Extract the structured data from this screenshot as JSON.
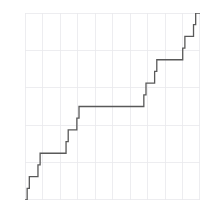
{
  "chart_data": {
    "type": "line",
    "title": "",
    "subtitle": "",
    "xlabel": "",
    "ylabel": "",
    "xlim": [
      0,
      1
    ],
    "ylim": [
      0,
      1
    ],
    "grid": true,
    "grid_color": "#e9e9ec",
    "x_gridlines": [
      0,
      0.1,
      0.2,
      0.3,
      0.4,
      0.5,
      0.6,
      0.7,
      0.8,
      0.9,
      1
    ],
    "y_gridlines": [
      0,
      0.2,
      0.4,
      0.6,
      0.8,
      1
    ],
    "xtick_labels": [],
    "ytick_labels": [],
    "legend": [],
    "legend_position": "none",
    "annotations": [],
    "series": [
      {
        "name": "Cantor function",
        "color": "#595959",
        "line_width": 1.3,
        "step": "post",
        "x": [
          0.0,
          0.012345679,
          0.012345679,
          0.024691358,
          0.024691358,
          0.037037037,
          0.037037037,
          0.074074074,
          0.074074074,
          0.086419753,
          0.086419753,
          0.098765432,
          0.098765432,
          0.111111111,
          0.111111111,
          0.222222222,
          0.222222222,
          0.234567901,
          0.234567901,
          0.24691358,
          0.24691358,
          0.259259259,
          0.259259259,
          0.296296296,
          0.296296296,
          0.308641975,
          0.308641975,
          0.320987654,
          0.320987654,
          0.333333333,
          0.333333333,
          0.666666667,
          0.666666667,
          0.679012346,
          0.679012346,
          0.691358025,
          0.691358025,
          0.703703704,
          0.703703704,
          0.740740741,
          0.740740741,
          0.75308642,
          0.75308642,
          0.765432099,
          0.765432099,
          0.777777778,
          0.777777778,
          0.888888889,
          0.888888889,
          0.901234568,
          0.901234568,
          0.913580247,
          0.913580247,
          0.925925926,
          0.925925926,
          0.962962963,
          0.962962963,
          0.975308642,
          0.975308642,
          0.987654321,
          0.987654321,
          1.0
        ],
        "y": [
          0.0,
          0.0,
          0.0625,
          0.0625,
          0.125,
          0.125,
          0.125,
          0.125,
          0.1875,
          0.1875,
          0.25,
          0.25,
          0.25,
          0.25,
          0.25,
          0.25,
          0.25,
          0.25,
          0.3125,
          0.3125,
          0.375,
          0.375,
          0.375,
          0.375,
          0.4375,
          0.4375,
          0.5,
          0.5,
          0.5,
          0.5,
          0.5,
          0.5,
          0.5,
          0.5,
          0.5625,
          0.5625,
          0.625,
          0.625,
          0.625,
          0.625,
          0.6875,
          0.6875,
          0.75,
          0.75,
          0.75,
          0.75,
          0.75,
          0.75,
          0.75,
          0.75,
          0.8125,
          0.8125,
          0.875,
          0.875,
          0.875,
          0.875,
          0.9375,
          0.9375,
          1.0,
          1.0,
          1.0,
          1.0
        ]
      }
    ]
  }
}
